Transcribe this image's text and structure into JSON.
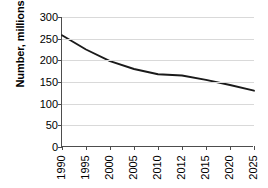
{
  "chart_data": {
    "type": "line",
    "title": "",
    "subtitle": "",
    "xlabel": "",
    "ylabel": "Number, millions",
    "categories": [
      "1990",
      "1995",
      "2000",
      "2005",
      "2010",
      "2012",
      "2015",
      "2020",
      "2025"
    ],
    "values": [
      258,
      225,
      198,
      180,
      168,
      165,
      155,
      143,
      130
    ],
    "series": [
      {
        "name": "Number, millions",
        "values": [
          258,
          225,
          198,
          180,
          168,
          165,
          155,
          143,
          130
        ]
      }
    ],
    "ylim": [
      0,
      300
    ],
    "yticks": [
      0,
      50,
      100,
      150,
      200,
      250,
      300
    ],
    "ytick_labels": [
      "0",
      "50",
      "100",
      "150",
      "200",
      "250",
      "300"
    ],
    "grid": "horizontal",
    "legend": "none",
    "line_color": "#1a1a1a",
    "gridline_color": "#d9d9d9",
    "axis_color": "#4d4d4d",
    "background_color": "#ffffff",
    "xtick_label_rotation": "-90",
    "annotations": []
  }
}
